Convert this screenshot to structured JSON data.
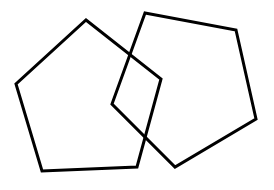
{
  "diagram": {
    "stroke_color": "#000000",
    "background": "#ffffff",
    "stroke_width": 3,
    "shapes": [
      {
        "name": "left-pentagon",
        "points": "86,20 161,79 137,167 42,171 16,84"
      },
      {
        "name": "right-pentagon",
        "points": "145,13 236,30 256,119 175,167 112,104"
      }
    ]
  }
}
